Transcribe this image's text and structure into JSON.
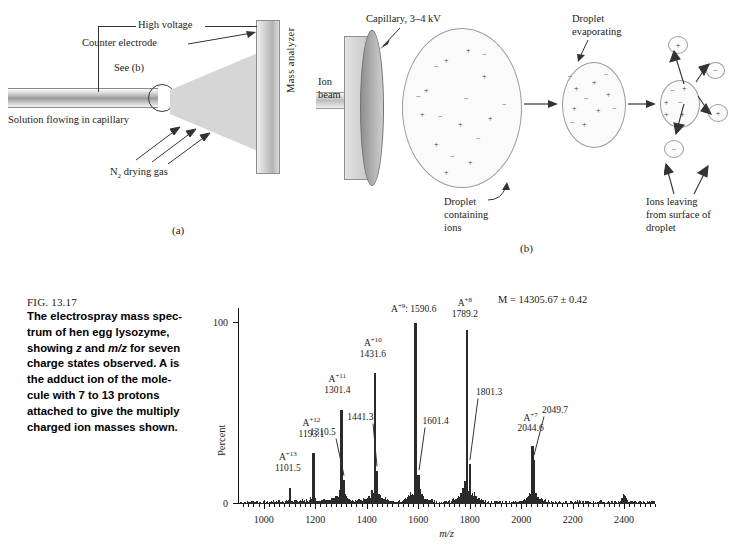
{
  "panel_a": {
    "label": "(a)",
    "annotations": {
      "high_voltage": "High voltage",
      "counter_electrode": "Counter electrode",
      "see_b": "See (b)",
      "solution": "Solution flowing in capillary",
      "drying_gas_pre": "N",
      "drying_gas_sub": "2",
      "drying_gas_post": " drying gas",
      "mass_analyzer": "Mass analyzer"
    }
  },
  "panel_b": {
    "label": "(b)",
    "annotations": {
      "capillary": "Capillary, 3–4 kV",
      "ion_beam_l1": "Ion",
      "ion_beam_l2": "beam",
      "droplet_evap_l1": "Droplet",
      "droplet_evap_l2": "evaporating",
      "droplet_ions_l1": "Droplet",
      "droplet_ions_l2": "containing",
      "droplet_ions_l3": "ions",
      "ions_leaving_l1": "Ions leaving",
      "ions_leaving_l2": "from surface of",
      "ions_leaving_l3": "droplet"
    }
  },
  "caption": {
    "figure_number": "FIG. 13.17",
    "line1": "The electrospray mass spec-",
    "line2": "trum of hen egg lysozyme,",
    "line3_a": "showing ",
    "line3_i1": "z",
    "line3_b": " and ",
    "line3_i2": "m/z",
    "line3_c": " for seven",
    "line4": "charge states observed. A is",
    "line5": "the adduct ion of the mole-",
    "line6": "cule with 7 to 13 protons",
    "line7": "attached to give the multiply",
    "line8": "charged ion masses shown."
  },
  "chart_data": {
    "type": "bar",
    "title": "",
    "xlabel": "m/z",
    "ylabel": "Percent",
    "xlim": [
      900,
      2520
    ],
    "ylim": [
      0,
      108
    ],
    "x_major_ticks": [
      1000,
      1200,
      1400,
      1600,
      1800,
      2000,
      2200,
      2400
    ],
    "x_minor_step": 20,
    "y_ticks": [
      0,
      100
    ],
    "y_tick_labels": [
      "0",
      "100"
    ],
    "grid": false,
    "annotation_mass": "M = 14305.67 ± 0.42",
    "peaks": [
      {
        "name": "A",
        "charge": "+13",
        "mz": 1101.5,
        "label_mz": "1101.5",
        "intensity": 9,
        "labeled": true
      },
      {
        "name": "A",
        "charge": "+12",
        "mz": 1193.1,
        "label_mz": "1193.1",
        "intensity": 28,
        "labeled": true
      },
      {
        "name": "A",
        "charge": "+11",
        "mz": 1301.4,
        "label_mz": "1301.4",
        "intensity": 52,
        "labeled": true
      },
      {
        "name": "A",
        "charge": "+10",
        "mz": 1431.6,
        "label_mz": "1431.6",
        "intensity": 72,
        "labeled": true
      },
      {
        "name": "A",
        "charge": "+9",
        "mz": 1590.6,
        "label_mz": "1590.6",
        "intensity": 100,
        "labeled": true
      },
      {
        "name": "A",
        "charge": "+8",
        "mz": 1789.2,
        "label_mz": "1789.2",
        "intensity": 96,
        "labeled": true
      },
      {
        "name": "A",
        "charge": "+7",
        "mz": 2044.6,
        "label_mz": "2044.6",
        "intensity": 32,
        "labeled": true
      }
    ],
    "satellites": [
      {
        "mz": 1310.5,
        "label": "1310.5",
        "intensity": 13
      },
      {
        "mz": 1441.3,
        "label": "1441.3",
        "intensity": 18
      },
      {
        "mz": 1601.4,
        "label": "1601.4",
        "intensity": 16
      },
      {
        "mz": 1801.3,
        "label": "1801.3",
        "intensity": 22
      },
      {
        "mz": 2049.7,
        "label": "2049.7",
        "intensity": 24
      }
    ],
    "label_a9_combined": "A+9: 1590.6"
  }
}
